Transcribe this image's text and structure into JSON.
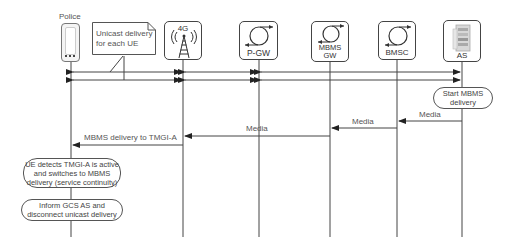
{
  "diagram": {
    "type": "sequence",
    "actors": [
      {
        "id": "police",
        "label": "Police",
        "icon": "phone-icon"
      },
      {
        "id": "enb",
        "label": "4G",
        "icon": "cell-tower-icon"
      },
      {
        "id": "pgw",
        "label": "P-GW",
        "icon": "router-icon"
      },
      {
        "id": "mbmsgw",
        "label": "MBMS GW",
        "label_line1": "MBMS",
        "label_line2": "GW",
        "icon": "router-icon"
      },
      {
        "id": "bmsc",
        "label": "BMSC",
        "icon": "router-icon"
      },
      {
        "id": "as",
        "label": "AS",
        "icon": "server-icon"
      }
    ],
    "note": {
      "text_line1": "Unicast delivery",
      "text_line2": "for each UE"
    },
    "messages": [
      {
        "from": "police",
        "to": "as",
        "label": "",
        "style": "bidirectional-unicast-1"
      },
      {
        "from": "police",
        "to": "as",
        "label": "",
        "style": "bidirectional-unicast-2"
      },
      {
        "from": "as",
        "to": "bmsc",
        "label": "Media"
      },
      {
        "from": "bmsc",
        "to": "mbmsgw",
        "label": "Media"
      },
      {
        "from": "mbmsgw",
        "to": "enb",
        "label": "Media"
      },
      {
        "from": "enb",
        "to": "police",
        "label": "MBMS delivery to TMGI-A"
      }
    ],
    "actions": [
      {
        "actor": "as",
        "line1": "Start MBMS",
        "line2": "delivery"
      },
      {
        "actor": "police",
        "line1": "UE detects TMGI-A is active",
        "line2": "and switches to MBMS",
        "line3": "delivery (service continuity)"
      },
      {
        "actor": "police",
        "line1": "Inform GCS AS and",
        "line2": "disconnect unicast delivery"
      }
    ]
  }
}
